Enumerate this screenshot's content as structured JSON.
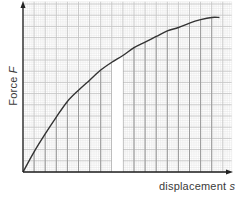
{
  "chart_data": {
    "type": "line",
    "title": "",
    "xlabel": "displacement s",
    "ylabel": "Force F",
    "xlabel_parts": {
      "text": "displacement ",
      "symbol": "s"
    },
    "ylabel_parts": {
      "text": "Force ",
      "symbol": "F"
    },
    "units": "grid squares (no numeric tick labels shown)",
    "xlim": [
      0,
      18.8
    ],
    "ylim": [
      0,
      15.2
    ],
    "grid": true,
    "grid_major_step": 1,
    "grid_minor_per_major": 5,
    "legend": null,
    "series": [
      {
        "name": "F vs s",
        "x": [
          0,
          1,
          2,
          3,
          4,
          5,
          6,
          7,
          8,
          9,
          10,
          11,
          12,
          13,
          14,
          15,
          16,
          17,
          17.7
        ],
        "y": [
          0,
          1.8,
          3.4,
          4.9,
          6.3,
          7.3,
          8.2,
          9.1,
          9.8,
          10.4,
          11.1,
          11.6,
          12.1,
          12.6,
          12.9,
          13.3,
          13.6,
          13.8,
          13.8
        ]
      }
    ],
    "annotations": [
      {
        "type": "highlighted-strip",
        "x_from": 8,
        "x_to": 9,
        "description": "white strip under curve (area element)"
      },
      {
        "type": "strip-lines",
        "description": "vertical strip lines under the curve at each major x grid line"
      }
    ]
  },
  "colors": {
    "background": "#ffffff",
    "grid_minor": "#e4e4e4",
    "grid_major": "#c4c4c4",
    "strip_lines": "#9a9a9a",
    "curve": "#333333",
    "axis": "#222222",
    "label": "#3a3a3a",
    "strip_fill": "#ffffff"
  }
}
